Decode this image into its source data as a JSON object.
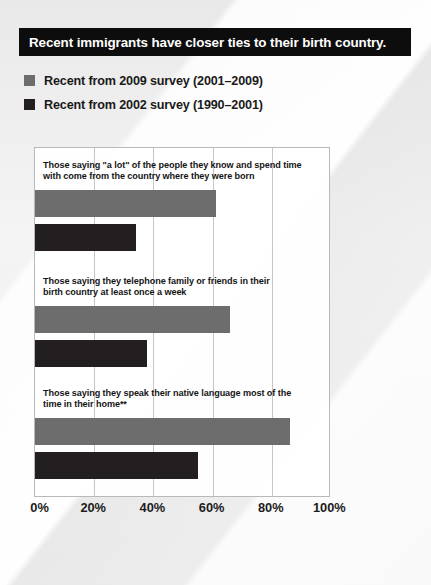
{
  "title": {
    "text": "Recent immigrants have closer ties to their birth country.",
    "bar_color": "#0d0d0d",
    "text_color": "#ffffff"
  },
  "legend": {
    "items": [
      {
        "label": "Recent from 2009 survey (2001–2009)",
        "color": "#6d6d6d",
        "series_key": "survey_2009"
      },
      {
        "label": "Recent from 2002 survey (1990–2001)",
        "color": "#231f20",
        "series_key": "survey_2002"
      }
    ]
  },
  "chart_data": {
    "type": "bar",
    "orientation": "horizontal",
    "title": "Recent immigrants have closer ties to their birth country.",
    "xlabel": "",
    "ylabel": "",
    "xlim": [
      0,
      100
    ],
    "xticks": [
      0,
      20,
      40,
      60,
      80,
      100
    ],
    "xtick_labels": [
      "0%",
      "20%",
      "40%",
      "60%",
      "80%",
      "100%"
    ],
    "grid": true,
    "grid_axis": "x",
    "legend_position": "above-plot",
    "categories": [
      "Those saying \"a lot\" of the people they know and spend time\nwith come from the country where they were born",
      "Those saying they telephone family or friends in their\nbirth country at least once a week",
      "Those saying they speak their native language most of the\ntime in their home**"
    ],
    "series": [
      {
        "name": "Recent from 2009 survey (2001–2009)",
        "color": "#6d6d6d",
        "values": [
          61,
          66,
          86
        ]
      },
      {
        "name": "Recent from 2002 survey (1990–2001)",
        "color": "#231f20",
        "values": [
          34,
          38,
          55
        ]
      }
    ],
    "annotations": [
      "**"
    ]
  }
}
